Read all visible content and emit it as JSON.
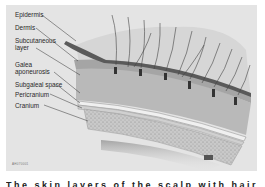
{
  "figure": {
    "title": "Layers of the scalp",
    "background": "#e4e4e4",
    "labels": [
      {
        "id": "epidermis",
        "text": "Epidermis"
      },
      {
        "id": "dermis",
        "text": "Dermis"
      },
      {
        "id": "subcutaneous-1",
        "text": "Subcutaneous"
      },
      {
        "id": "subcutaneous-2",
        "text": "layer"
      },
      {
        "id": "galea-1",
        "text": "Galea"
      },
      {
        "id": "galea-2",
        "text": "aponeurosis"
      },
      {
        "id": "subgaleal",
        "text": "Subgaleal space"
      },
      {
        "id": "pericranium",
        "text": "Pericranium"
      },
      {
        "id": "cranium",
        "text": "Cranium"
      }
    ],
    "figure_id": "AH070001",
    "scale_bar_icon": "scale-bar"
  },
  "caption": {
    "text": "The skin layers of the scalp with hair follicles and the cranium"
  }
}
